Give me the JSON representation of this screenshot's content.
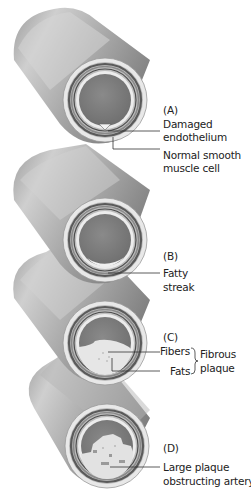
{
  "figure": {
    "colors": {
      "tube_light": "#c8c8c8",
      "tube_dark": "#8c8c8c",
      "lumen": "#7a7a7a",
      "wall_ring": "#dcdcdc",
      "muscle_ring": "#5a5a5a",
      "plaque": "#e4e4e4",
      "leader_line": "#333333",
      "text": "#222222"
    },
    "stages": [
      {
        "id": "A",
        "label": "(A)",
        "callouts": [
          {
            "text_lines": [
              "Damaged",
              "endothelium"
            ]
          },
          {
            "text_lines": [
              "Normal smooth",
              "muscle cell"
            ]
          }
        ]
      },
      {
        "id": "B",
        "label": "(B)",
        "callouts": [
          {
            "text_lines": [
              "Fatty",
              "streak"
            ]
          }
        ]
      },
      {
        "id": "C",
        "label": "(C)",
        "callouts": [
          {
            "text_lines": [
              "Fibers"
            ]
          },
          {
            "text_lines": [
              "Fats"
            ]
          }
        ],
        "bracket_label_lines": [
          "Fibrous",
          "plaque"
        ]
      },
      {
        "id": "D",
        "label": "(D)",
        "callouts": [
          {
            "text_lines": [
              "Large plaque",
              "obstructing artery"
            ]
          }
        ]
      }
    ]
  }
}
